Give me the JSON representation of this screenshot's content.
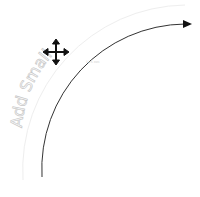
{
  "canvas": {
    "arc_text": "Add Small",
    "dimension_label": "12.5 mm",
    "cursor": "move-cursor-icon",
    "colors": {
      "arc_stroke": "#333333",
      "guide_arc": "#eeeeee",
      "ghost_text": "#d0d0d0",
      "cursor": "#111111"
    }
  }
}
